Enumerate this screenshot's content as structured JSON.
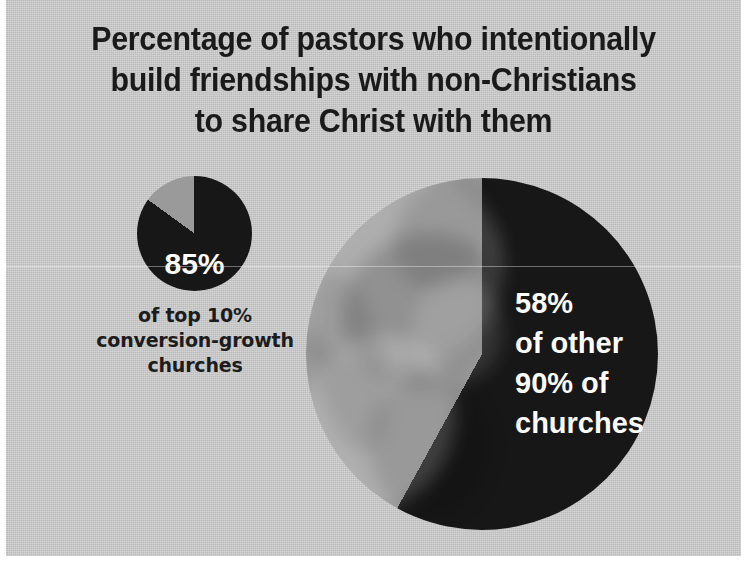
{
  "chart_data": {
    "type": "pie",
    "title": "Percentage of pastors who intentionally build friendships with non-Christians to share Christ with them",
    "title_lines": [
      "Percentage of pastors who intentionally",
      "build friendships with non-Christians",
      "to share Christ with them"
    ],
    "xlabel": "",
    "ylabel": "",
    "legend": "none",
    "grid": false,
    "colors": {
      "background": "#c9c9c9",
      "slice_dark": "#171717",
      "slice_light": "#9a9a9a",
      "title_text": "#1a1a1a",
      "value_text": "#ffffff"
    },
    "charts": [
      {
        "name": "top-10-percent-conversion-growth-churches",
        "size": "small",
        "value_label": "85%",
        "caption_lines": [
          "of top 10%",
          "conversion-growth",
          "churches"
        ],
        "caption": "of top 10% conversion-growth churches",
        "categories": [
          "Intentionally build friendships",
          "Do not"
        ],
        "values": [
          85,
          15
        ]
      },
      {
        "name": "other-90-percent-of-churches",
        "size": "large",
        "value_label": "58%",
        "caption_lines": [
          "of other",
          "90% of",
          "churches"
        ],
        "caption": "of other 90% of churches",
        "categories": [
          "Intentionally build friendships",
          "Do not"
        ],
        "values": [
          58,
          42
        ]
      }
    ]
  }
}
